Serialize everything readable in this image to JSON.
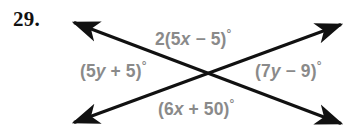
{
  "figure": {
    "problem_number": "29.",
    "background_color": "#ffffff",
    "line_color": "#111111",
    "label_color": "#8a8a8a",
    "number_color": "#111111",
    "intersection": {
      "x": 208,
      "y": 72
    }
  },
  "labels": {
    "top": {
      "text": "2(5x − 5)°",
      "position": "top",
      "coefficient": "2",
      "expression": "5x − 5",
      "variable": "x"
    },
    "left": {
      "text": "(5y + 5)°",
      "position": "left",
      "expression": "5y + 5",
      "variable": "y"
    },
    "right": {
      "text": "(7y − 9)°",
      "position": "right",
      "expression": "7y − 9",
      "variable": "y"
    },
    "bottom": {
      "text": "(6x + 50)°",
      "position": "bottom",
      "expression": "6x + 50",
      "variable": "x"
    }
  },
  "lines": [
    {
      "name": "line-nw-se",
      "from": {
        "x": 70,
        "y": 21
      },
      "to": {
        "x": 345,
        "y": 125
      },
      "arrow_start": true,
      "arrow_end": true
    },
    {
      "name": "line-sw-ne",
      "from": {
        "x": 70,
        "y": 124
      },
      "to": {
        "x": 345,
        "y": 23
      },
      "arrow_start": true,
      "arrow_end": true
    }
  ]
}
